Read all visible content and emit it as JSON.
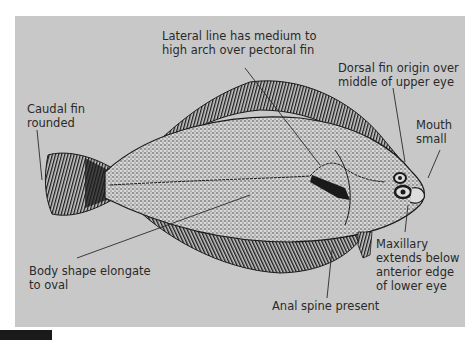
{
  "figure": {
    "panel_color": "#c8c8c8",
    "ink_color": "#1a1a1a",
    "labels": {
      "lateral_line": "Lateral line has medium to\nhigh arch over pectoral fin",
      "dorsal_fin": "Dorsal fin origin over\nmiddle of upper eye",
      "mouth": "Mouth\nsmall",
      "caudal_fin": "Caudal fin\nrounded",
      "body_shape": "Body shape elongate\nto oval",
      "maxillary": "Maxillary\nextends below\nanterior edge\nof lower eye",
      "anal_spine": "Anal spine present"
    }
  }
}
